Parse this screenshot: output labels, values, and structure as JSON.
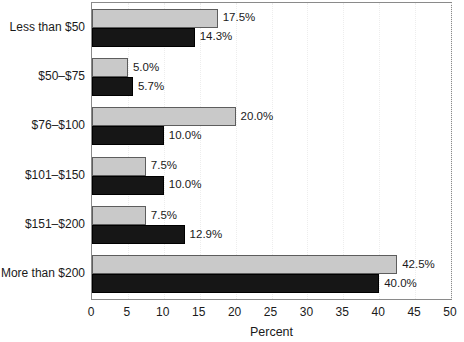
{
  "chart_data": {
    "type": "bar",
    "orientation": "horizontal",
    "title": "",
    "xlabel": "Percent",
    "ylabel": "",
    "xlim": [
      0,
      50
    ],
    "xticks": [
      0,
      5,
      10,
      15,
      20,
      25,
      30,
      35,
      40,
      45,
      50
    ],
    "xtick_labels": [
      "0",
      "5",
      "10",
      "15",
      "20",
      "25",
      "30",
      "35",
      "40",
      "45",
      "50"
    ],
    "grid": true,
    "legend": "none",
    "categories": [
      "Less than $50",
      "$50–$75",
      "$76–$100",
      "$101–$150",
      "$151–$200",
      "More than $200"
    ],
    "series": [
      {
        "name": "series-light",
        "color": "#c9c9c9",
        "values": [
          17.5,
          5.0,
          20.0,
          7.5,
          7.5,
          42.5
        ],
        "labels": [
          "17.5%",
          "5.0%",
          "20.0%",
          "7.5%",
          "7.5%",
          "42.5%"
        ]
      },
      {
        "name": "series-dark",
        "color": "#161616",
        "values": [
          14.3,
          5.7,
          10.0,
          10.0,
          12.9,
          40.0
        ],
        "labels": [
          "14.3%",
          "5.7%",
          "10.0%",
          "10.0%",
          "12.9%",
          "40.0%"
        ]
      }
    ]
  },
  "colors": {
    "light_bar": "#c9c9c9",
    "dark_bar": "#161616",
    "axis": "#8a8a8a",
    "gridline": "#ededed",
    "text": "#1a1a1a",
    "background": "#ffffff"
  }
}
